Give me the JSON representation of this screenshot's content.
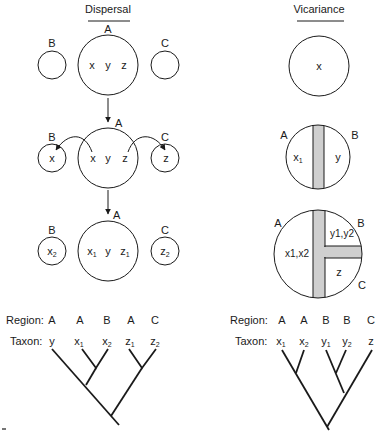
{
  "dispersal": {
    "title": "Dispersal",
    "stage1": {
      "main_region": "A",
      "left_region": "B",
      "right_region": "C",
      "main_taxa": [
        "x",
        "y",
        "z"
      ]
    },
    "stage2": {
      "main_region": "A",
      "left_region": "B",
      "right_region": "C",
      "main_taxa": [
        "x",
        "y",
        "z"
      ],
      "left_taxon": "x",
      "right_taxon": "z"
    },
    "stage3": {
      "main_region": "A",
      "left_region": "B",
      "right_region": "C",
      "main_taxa": [
        {
          "base": "x",
          "sub": "1"
        },
        {
          "base": "y",
          "sub": ""
        },
        {
          "base": "z",
          "sub": "1"
        }
      ],
      "left_taxon": {
        "base": "x",
        "sub": "2"
      },
      "right_taxon": {
        "base": "z",
        "sub": "2"
      }
    },
    "cladogram": {
      "region_label": "Region:",
      "taxon_label": "Taxon:",
      "regions": [
        "A",
        "A",
        "B",
        "A",
        "C"
      ],
      "taxa": [
        {
          "base": "y",
          "sub": ""
        },
        {
          "base": "x",
          "sub": "1"
        },
        {
          "base": "x",
          "sub": "2"
        },
        {
          "base": "z",
          "sub": "1"
        },
        {
          "base": "z",
          "sub": "2"
        }
      ]
    }
  },
  "vicariance": {
    "title": "Vicariance",
    "stage1": {
      "taxon": "x"
    },
    "stage2": {
      "left_region": "A",
      "right_region": "B",
      "left_taxon": {
        "base": "x",
        "sub": "1"
      },
      "right_taxon": {
        "base": "y",
        "sub": ""
      }
    },
    "stage3": {
      "region_a": "A",
      "region_b": "B",
      "region_c": "C",
      "left_taxa": "x1,x2",
      "upper_right_taxa": "y1,y2",
      "lower_right_taxon": "z"
    },
    "cladogram": {
      "region_label": "Region:",
      "taxon_label": "Taxon:",
      "regions": [
        "A",
        "A",
        "B",
        "B",
        "C"
      ],
      "taxa": [
        {
          "base": "x",
          "sub": "1"
        },
        {
          "base": "x",
          "sub": "2"
        },
        {
          "base": "y",
          "sub": "1"
        },
        {
          "base": "y",
          "sub": "2"
        },
        {
          "base": "z",
          "sub": ""
        }
      ]
    }
  },
  "colors": {
    "ink": "#1a1a1a",
    "barrier": "#cfcfcf",
    "background": "#ffffff"
  }
}
